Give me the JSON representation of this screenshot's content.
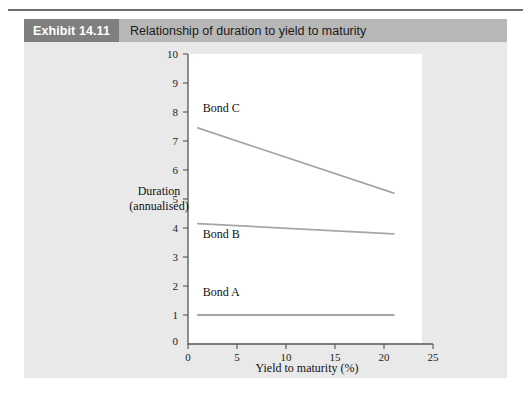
{
  "exhibit": {
    "badge_label": "Exhibit 14.11",
    "title": "Relationship of duration to yield to maturity"
  },
  "colors": {
    "badge_bg": "#7f7f7f",
    "title_bar_bg": "#b7b7b7",
    "panel_bg": "#e9e9e9",
    "plot_bg": "#ffffff",
    "line": "#a6a6a6",
    "axis": "#545454"
  },
  "chart_data": {
    "type": "line",
    "title": "Relationship of duration to yield to maturity",
    "xlabel": "Yield to maturity (%)",
    "ylabel": "Duration (annualised)",
    "ylabel_line1": "Duration",
    "ylabel_line2": "(annualised)",
    "xlim": [
      0,
      25
    ],
    "ylim": [
      0,
      10
    ],
    "xticks": [
      0,
      5,
      10,
      15,
      20,
      25
    ],
    "yticks": [
      0,
      1,
      2,
      3,
      4,
      5,
      6,
      7,
      8,
      9,
      10
    ],
    "grid": false,
    "legend_position": "inline-labels",
    "series": [
      {
        "name": "Bond A",
        "label": "Bond A",
        "x": [
          1,
          21
        ],
        "values": [
          1.0,
          1.0
        ]
      },
      {
        "name": "Bond B",
        "label": "Bond B",
        "x": [
          1,
          21
        ],
        "values": [
          4.15,
          3.8
        ]
      },
      {
        "name": "Bond C",
        "label": "Bond C",
        "x": [
          1,
          21
        ],
        "values": [
          7.45,
          5.2
        ]
      }
    ],
    "annotations": [
      {
        "text": "Bond C",
        "x": 1.5,
        "y": 8.0
      },
      {
        "text": "Bond B",
        "x": 1.5,
        "y": 3.65
      },
      {
        "text": "Bond A",
        "x": 1.5,
        "y": 1.65
      }
    ]
  }
}
